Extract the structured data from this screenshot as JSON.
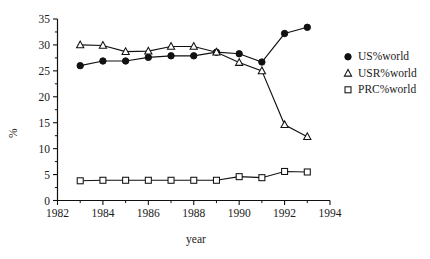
{
  "chart_data": {
    "type": "line",
    "title": "",
    "xlabel": "year",
    "ylabel": "%",
    "xlim": [
      1982,
      1994
    ],
    "ylim": [
      0,
      35
    ],
    "xticks": [
      1982,
      1984,
      1986,
      1988,
      1990,
      1992,
      1994
    ],
    "xtick_labels": [
      "1982",
      "1984",
      "1986",
      "1988",
      "1990",
      "1992",
      "1994"
    ],
    "xminor_ticks": [
      1983,
      1985,
      1987,
      1989,
      1991,
      1993
    ],
    "yticks": [
      0,
      5,
      10,
      15,
      20,
      25,
      30,
      35
    ],
    "ytick_labels": [
      "0",
      "5",
      "10",
      "15",
      "20",
      "25",
      "30",
      "35"
    ],
    "grid": false,
    "legend_position": "right",
    "x": [
      1983,
      1984,
      1985,
      1986,
      1987,
      1988,
      1989,
      1990,
      1991,
      1992,
      1993
    ],
    "series": [
      {
        "name": "US%world",
        "marker": "filled-circle",
        "values": [
          26.0,
          26.9,
          26.9,
          27.6,
          27.9,
          27.9,
          28.6,
          28.3,
          26.7,
          32.2,
          33.4
        ]
      },
      {
        "name": "USR%world",
        "marker": "open-triangle",
        "values": [
          30.0,
          29.9,
          28.7,
          28.8,
          29.7,
          29.7,
          28.6,
          26.6,
          25.0,
          14.6,
          12.3
        ]
      },
      {
        "name": "PRC%world",
        "marker": "open-square",
        "values": [
          3.8,
          3.9,
          3.9,
          3.9,
          3.9,
          3.9,
          3.9,
          4.6,
          4.4,
          5.6,
          5.5
        ]
      }
    ],
    "colors": {
      "line": "#111111",
      "marker_fill": "#111111",
      "marker_open_fill": "#ffffff",
      "background": "#ffffff"
    }
  },
  "legend": {
    "entries": [
      {
        "label": "US%world",
        "marker": "filled-circle"
      },
      {
        "label": "USR%world",
        "marker": "open-triangle"
      },
      {
        "label": "PRC%world",
        "marker": "open-square"
      }
    ]
  },
  "axes": {
    "y_axis_title": "%",
    "x_axis_title": "year"
  }
}
